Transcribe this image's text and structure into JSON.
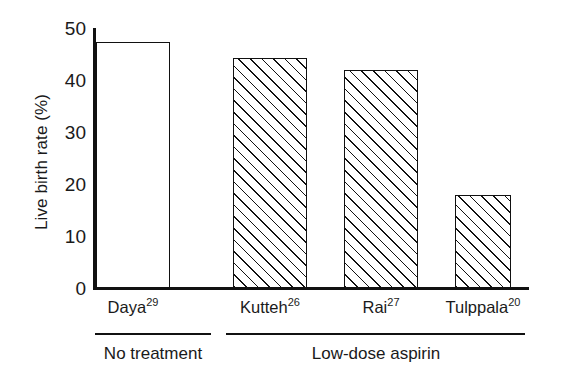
{
  "chart_data": {
    "type": "bar",
    "title": "",
    "xlabel": "",
    "ylabel": "Live birth rate (%)",
    "ylim": [
      0,
      50
    ],
    "ytick_labels": [
      "50",
      "40",
      "30",
      "20",
      "10",
      "0"
    ],
    "ytick_values": [
      50,
      40,
      30,
      20,
      10,
      0
    ],
    "grid": false,
    "legend": "none",
    "categories": [
      "Daya",
      "Kutteh",
      "Rai",
      "Tulppala"
    ],
    "category_refs": [
      "29",
      "26",
      "27",
      "20"
    ],
    "values": [
      47.5,
      44.4,
      42.0,
      18.0
    ],
    "bar_styles": [
      "open",
      "hatched",
      "hatched",
      "hatched"
    ],
    "groups": [
      {
        "label": "No treatment",
        "members": [
          "Daya"
        ]
      },
      {
        "label": "Low-dose aspirin",
        "members": [
          "Kutteh",
          "Rai",
          "Tulppala"
        ]
      }
    ],
    "colors": {
      "line": "#111111",
      "fill": "#ffffff",
      "background": "#ffffff"
    }
  },
  "axis": {
    "y_title": "Live birth rate (%)",
    "ticks": [
      {
        "label": "50",
        "value": 50
      },
      {
        "label": "40",
        "value": 40
      },
      {
        "label": "30",
        "value": 30
      },
      {
        "label": "20",
        "value": 20
      },
      {
        "label": "10",
        "value": 10
      },
      {
        "label": "0",
        "value": 0
      }
    ]
  },
  "bars": [
    {
      "name": "Daya",
      "ref": "29",
      "value": 47.5,
      "style": "open"
    },
    {
      "name": "Kutteh",
      "ref": "26",
      "value": 44.4,
      "style": "hatched"
    },
    {
      "name": "Rai",
      "ref": "27",
      "value": 42.0,
      "style": "hatched"
    },
    {
      "name": "Tulppala",
      "ref": "20",
      "value": 18.0,
      "style": "hatched"
    }
  ],
  "groups": [
    {
      "label": "No treatment"
    },
    {
      "label": "Low-dose aspirin"
    }
  ]
}
